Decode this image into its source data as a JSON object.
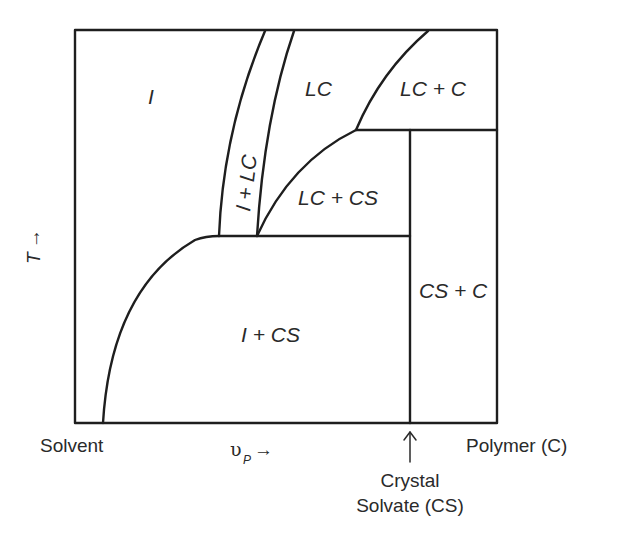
{
  "diagram": {
    "type": "phase-diagram",
    "y_axis": {
      "label": "T",
      "arrow": "→"
    },
    "x_axis": {
      "label": "υ",
      "subscript": "P",
      "arrow": "→"
    },
    "x_endpoints": {
      "left": "Solvent",
      "right": "Polymer (C)",
      "marker": {
        "line1": "Crystal",
        "line2": "Solvate (CS)",
        "arrow": "↑"
      }
    },
    "regions": {
      "isotropic": "I",
      "isotropic_lc": "I + LC",
      "lc": "LC",
      "lc_c": "LC + C",
      "lc_cs": "LC + CS",
      "isotropic_cs": "I + CS",
      "cs_c": "CS + C"
    }
  }
}
